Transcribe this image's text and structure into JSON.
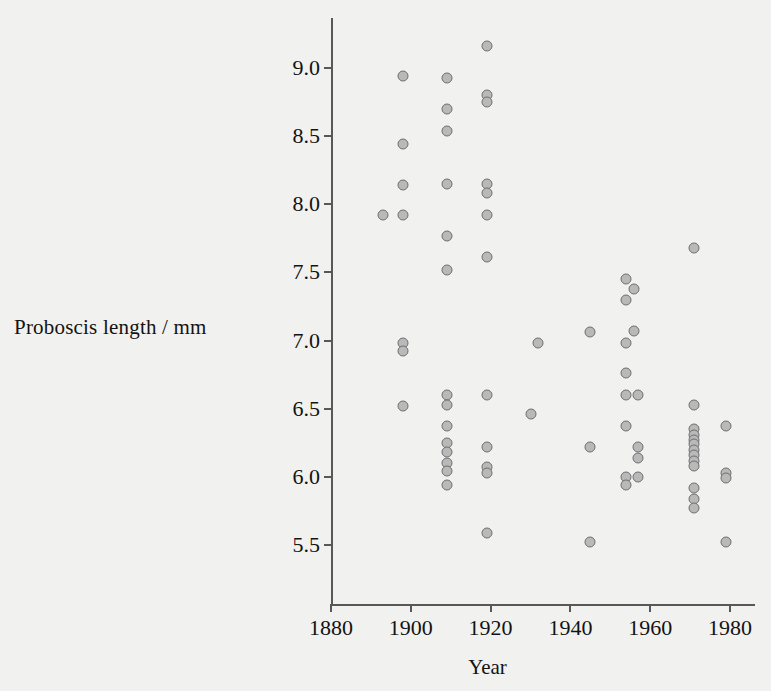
{
  "chart_data": {
    "type": "scatter",
    "title": "",
    "subtitle": "",
    "xlabel": "Year",
    "ylabel": "Proboscis length / mm",
    "xlim": [
      1876,
      1984
    ],
    "ylim": [
      5.3,
      9.3
    ],
    "xticks": [
      1880,
      1900,
      1920,
      1940,
      1960,
      1980
    ],
    "xticklabels": [
      "1880",
      "1900",
      "1920",
      "1940",
      "1960",
      "1980"
    ],
    "yticks": [
      5.5,
      6.0,
      6.5,
      7.0,
      7.5,
      8.0,
      8.5,
      9.0
    ],
    "yticklabels": [
      "5.5",
      "6.0",
      "6.5",
      "7.0",
      "7.5",
      "8.0",
      "8.5",
      "9.0"
    ],
    "grid": false,
    "legend": null,
    "marker": {
      "shape": "circle",
      "fill_color": "#b9b9b9",
      "edge_color": "#6e6e70",
      "size_px": 11
    },
    "background_color": "#f1f1ef",
    "axis_color": "#58585a",
    "text_color": "#131313",
    "n_points": 60,
    "points": [
      {
        "x": 1893,
        "y": 7.92
      },
      {
        "x": 1898,
        "y": 8.94
      },
      {
        "x": 1898,
        "y": 8.44
      },
      {
        "x": 1898,
        "y": 8.14
      },
      {
        "x": 1898,
        "y": 7.92
      },
      {
        "x": 1898,
        "y": 6.98
      },
      {
        "x": 1898,
        "y": 6.92
      },
      {
        "x": 1898,
        "y": 6.52
      },
      {
        "x": 1909,
        "y": 8.93
      },
      {
        "x": 1909,
        "y": 8.7
      },
      {
        "x": 1909,
        "y": 8.54
      },
      {
        "x": 1909,
        "y": 8.15
      },
      {
        "x": 1909,
        "y": 7.77
      },
      {
        "x": 1909,
        "y": 7.52
      },
      {
        "x": 1909,
        "y": 6.6
      },
      {
        "x": 1909,
        "y": 6.53
      },
      {
        "x": 1909,
        "y": 6.37
      },
      {
        "x": 1909,
        "y": 6.25
      },
      {
        "x": 1909,
        "y": 6.18
      },
      {
        "x": 1909,
        "y": 6.1
      },
      {
        "x": 1909,
        "y": 6.04
      },
      {
        "x": 1909,
        "y": 5.94
      },
      {
        "x": 1919,
        "y": 9.16
      },
      {
        "x": 1919,
        "y": 8.8
      },
      {
        "x": 1919,
        "y": 8.75
      },
      {
        "x": 1919,
        "y": 8.15
      },
      {
        "x": 1919,
        "y": 8.08
      },
      {
        "x": 1919,
        "y": 7.92
      },
      {
        "x": 1919,
        "y": 7.61
      },
      {
        "x": 1919,
        "y": 6.6
      },
      {
        "x": 1919,
        "y": 6.22
      },
      {
        "x": 1919,
        "y": 6.07
      },
      {
        "x": 1919,
        "y": 6.03
      },
      {
        "x": 1919,
        "y": 5.59
      },
      {
        "x": 1930,
        "y": 6.46
      },
      {
        "x": 1932,
        "y": 6.98
      },
      {
        "x": 1945,
        "y": 7.06
      },
      {
        "x": 1945,
        "y": 6.22
      },
      {
        "x": 1945,
        "y": 5.52
      },
      {
        "x": 1954,
        "y": 7.45
      },
      {
        "x": 1954,
        "y": 7.3
      },
      {
        "x": 1954,
        "y": 6.98
      },
      {
        "x": 1954,
        "y": 6.76
      },
      {
        "x": 1954,
        "y": 6.6
      },
      {
        "x": 1954,
        "y": 6.37
      },
      {
        "x": 1954,
        "y": 6.0
      },
      {
        "x": 1954,
        "y": 5.94
      },
      {
        "x": 1956,
        "y": 7.38
      },
      {
        "x": 1956,
        "y": 7.07
      },
      {
        "x": 1957,
        "y": 6.6
      },
      {
        "x": 1957,
        "y": 6.22
      },
      {
        "x": 1957,
        "y": 6.14
      },
      {
        "x": 1957,
        "y": 6.0
      },
      {
        "x": 1971,
        "y": 7.68
      },
      {
        "x": 1971,
        "y": 6.53
      },
      {
        "x": 1971,
        "y": 6.35
      },
      {
        "x": 1971,
        "y": 6.31
      },
      {
        "x": 1971,
        "y": 6.27
      },
      {
        "x": 1971,
        "y": 6.24
      },
      {
        "x": 1971,
        "y": 6.2
      },
      {
        "x": 1971,
        "y": 6.16
      },
      {
        "x": 1971,
        "y": 6.12
      },
      {
        "x": 1971,
        "y": 6.08
      },
      {
        "x": 1971,
        "y": 5.92
      },
      {
        "x": 1971,
        "y": 5.84
      },
      {
        "x": 1971,
        "y": 5.77
      },
      {
        "x": 1979,
        "y": 6.37
      },
      {
        "x": 1979,
        "y": 6.03
      },
      {
        "x": 1979,
        "y": 5.99
      },
      {
        "x": 1979,
        "y": 5.52
      }
    ]
  }
}
